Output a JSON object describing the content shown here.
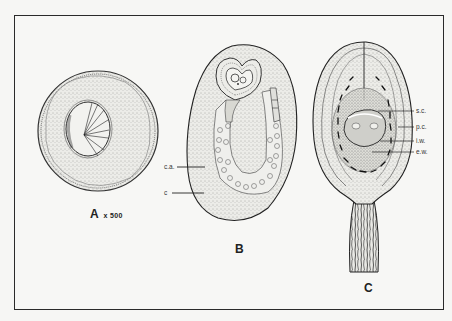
{
  "figure": {
    "panels": [
      {
        "id": "A",
        "letter": "A",
        "magnification": "x 500",
        "annotations": []
      },
      {
        "id": "B",
        "letter": "B",
        "annotations": [
          "c.a.",
          "c"
        ]
      },
      {
        "id": "C",
        "letter": "C",
        "annotations": [
          "s.c.",
          "p.c.",
          "i.w.",
          "e.w."
        ]
      }
    ]
  },
  "colors": {
    "ink": "#2a2a2a",
    "paper": "#f7f7f5",
    "stipple": "#e4e4e0"
  }
}
